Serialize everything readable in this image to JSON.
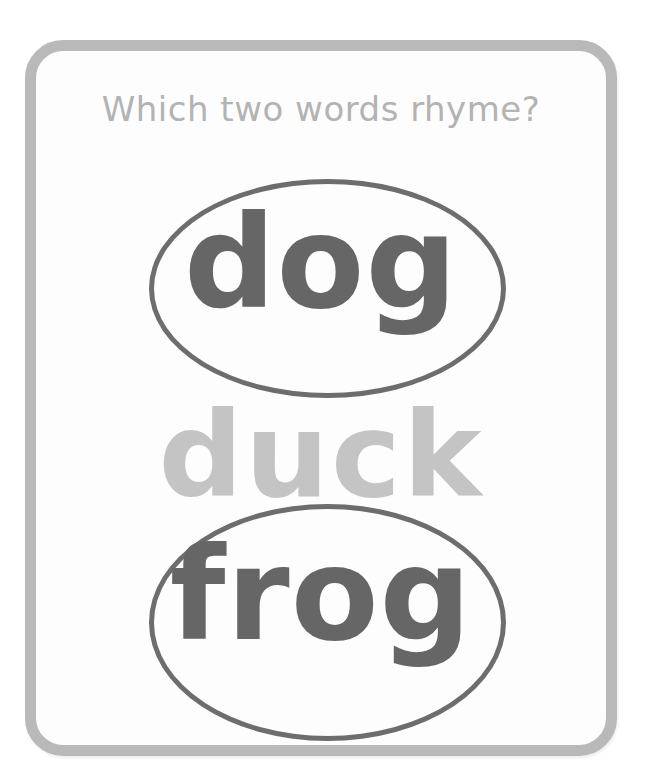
{
  "card": {
    "question": "Which two words rhyme?",
    "words": [
      {
        "text": "dog",
        "circled": true
      },
      {
        "text": "duck",
        "circled": false
      },
      {
        "text": "frog",
        "circled": true
      }
    ]
  },
  "colors": {
    "border": "#b9b9b9",
    "question_text": "#b3b3b3",
    "circled_word": "#666666",
    "faded_word": "#c4c4c4",
    "ellipse_stroke": "#6d6d6d"
  }
}
